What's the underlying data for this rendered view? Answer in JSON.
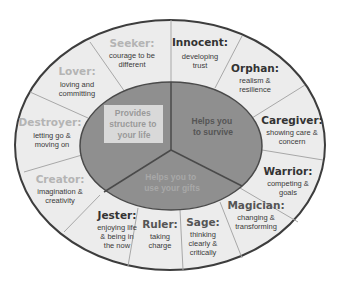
{
  "colors": {
    "outer_band": "#ececec",
    "outer_stroke": "#3d3d3d",
    "divider": "#a8a8a8",
    "inner_fill": "#8f8f8f",
    "inner_stroke": "#4a4a4a",
    "title_dark": "#333333",
    "title_light": "#b4b4b4",
    "core_box": "#d9d9d9"
  },
  "core": {
    "structure": {
      "line1": "Provides",
      "line2": "structure to",
      "line3": "your life"
    },
    "survive": {
      "line1": "Helps you",
      "line2": "to survive"
    },
    "gifts": {
      "line1": "Helps you to",
      "line2": "use your gifts"
    }
  },
  "archetypes": [
    {
      "title": "Seeker:",
      "desc1": "courage to be",
      "desc2": "different"
    },
    {
      "title": "Innocent:",
      "desc1": "developing",
      "desc2": "trust"
    },
    {
      "title": "Orphan:",
      "desc1": "realism &",
      "desc2": "resilience"
    },
    {
      "title": "Caregiver:",
      "desc1": "showing care &",
      "desc2": "concern"
    },
    {
      "title": "Warrior:",
      "desc1": "competing &",
      "desc2": "goals"
    },
    {
      "title": "Magician:",
      "desc1": "changing &",
      "desc2": "transforming"
    },
    {
      "title": "Sage:",
      "desc1": "thinking",
      "desc2": "clearly &",
      "desc3": "critically"
    },
    {
      "title": "Ruler:",
      "desc1": "taking",
      "desc2": "charge"
    },
    {
      "title": "Jester:",
      "desc1": "enjoying life",
      "desc2": "& being in",
      "desc3": "the now"
    },
    {
      "title": "Creator:",
      "desc1": "imagination &",
      "desc2": "creativity"
    },
    {
      "title": "Destroyer:",
      "desc1": "letting go &",
      "desc2": "moving on"
    },
    {
      "title": "Lover:",
      "desc1": "loving and",
      "desc2": "committing"
    }
  ]
}
